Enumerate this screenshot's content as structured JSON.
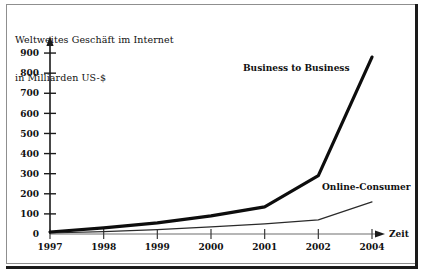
{
  "chart_data": {
    "type": "line",
    "title": "Weltweites Geschäft im Internet\nin Milliarden US-$",
    "title_line1": "Weltweites Geschäft im Internet",
    "title_line2": "in Milliarden US-$",
    "xlabel": "Zeit",
    "ylabel": "in Milliarden US-$",
    "grid": false,
    "legend_position": "inline-annotations",
    "ylim": [
      0,
      950
    ],
    "ytick_labels": [
      "0",
      "100",
      "200",
      "300",
      "400",
      "500",
      "600",
      "700",
      "800",
      "900"
    ],
    "yticks": [
      0,
      100,
      200,
      300,
      400,
      500,
      600,
      700,
      800,
      900
    ],
    "categories": [
      "1997",
      "1998",
      "1999",
      "2000",
      "2001",
      "2002",
      "2004"
    ],
    "xtick_labels": [
      "1997",
      "1998",
      "1999",
      "2000",
      "2001",
      "2002",
      "2004"
    ],
    "series": [
      {
        "name": "Business to Business",
        "values": [
          10,
          30,
          55,
          90,
          135,
          290,
          880
        ],
        "style": "thick"
      },
      {
        "name": "Online-Consumer",
        "values": [
          5,
          12,
          22,
          35,
          50,
          70,
          160
        ],
        "style": "thin"
      }
    ],
    "annotations": [
      {
        "text": "Business to Business",
        "x_px": 243,
        "y_px": 71
      },
      {
        "text": "Online-Consumer",
        "x_px": 322,
        "y_px": 190
      }
    ],
    "colors": {
      "background": "#ffffff",
      "axis": "#1a1a1a",
      "business_to_business": "#0d0d0d",
      "online_consumer": "#2a2a2a",
      "frame": "#8f8f8f",
      "frame_rule": "#1a1a1a",
      "text": "#111111"
    }
  }
}
